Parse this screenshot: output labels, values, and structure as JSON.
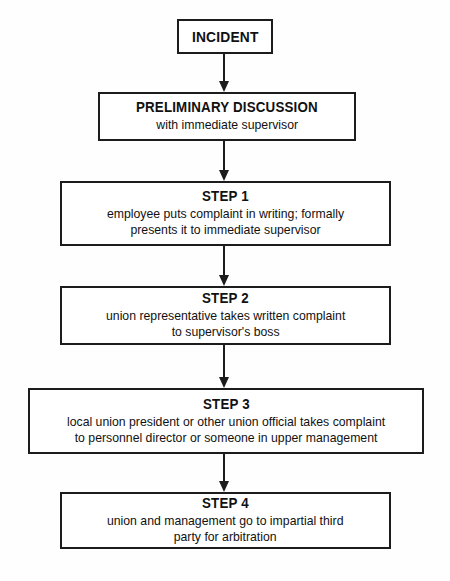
{
  "diagram": {
    "type": "flowchart",
    "orientation": "top-to-bottom",
    "nodes": [
      {
        "id": "incident",
        "title": "INCIDENT",
        "body": ""
      },
      {
        "id": "preliminary-discussion",
        "title": "PRELIMINARY DISCUSSION",
        "body": "with immediate supervisor"
      },
      {
        "id": "step-1",
        "title": "STEP 1",
        "body": "employee puts complaint in writing; formally\npresents it to immediate supervisor"
      },
      {
        "id": "step-2",
        "title": "STEP 2",
        "body": "union representative takes written complaint\nto supervisor's boss"
      },
      {
        "id": "step-3",
        "title": "STEP 3",
        "body": "local union president or other union official takes complaint\nto personnel director or someone in upper management"
      },
      {
        "id": "step-4",
        "title": "STEP 4",
        "body": "union and management go to impartial third\nparty for arbitration"
      }
    ],
    "connectors": [
      {
        "id": "conn-1",
        "from": "incident",
        "to": "preliminary-discussion",
        "arrow": "down-arrow-icon"
      },
      {
        "id": "conn-2",
        "from": "preliminary-discussion",
        "to": "step-1",
        "arrow": "down-arrow-icon"
      },
      {
        "id": "conn-3",
        "from": "step-1",
        "to": "step-2",
        "arrow": "down-arrow-icon"
      },
      {
        "id": "conn-4",
        "from": "step-2",
        "to": "step-3",
        "arrow": "down-arrow-icon"
      },
      {
        "id": "conn-5",
        "from": "step-3",
        "to": "step-4",
        "arrow": "down-arrow-icon"
      }
    ],
    "colors": {
      "background": "#fefefe",
      "box_fill": "#ffffff",
      "border": "#1c1c1c",
      "text": "#111111"
    }
  }
}
